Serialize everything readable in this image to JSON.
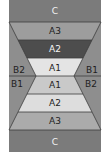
{
  "diagram": {
    "top": {
      "band_c": {
        "label": "C",
        "color": "#7b7b7b",
        "text_color": "#f2f2f2"
      },
      "a3": {
        "label": "A3",
        "color": "#9d9d9d",
        "text_color": "#1e1e1e"
      },
      "a2": {
        "label": "A2",
        "color": "#4d4d4d",
        "text_color": "#f5f5f5"
      },
      "a1": {
        "label": "A1",
        "color": "#e4e4e4",
        "text_color": "#1e1e1e"
      },
      "left_side": {
        "label": "B2"
      },
      "right_side": {
        "label": "B1"
      }
    },
    "bottom": {
      "a1": {
        "label": "A1",
        "color": "#c9c9c9",
        "text_color": "#1e1e1e"
      },
      "a2": {
        "label": "A2",
        "color": "#dddddd",
        "text_color": "#1e1e1e"
      },
      "a3": {
        "label": "A3",
        "color": "#ababab",
        "text_color": "#1e1e1e"
      },
      "band_c": {
        "label": "C",
        "color": "#7b7b7b",
        "text_color": "#f2f2f2"
      },
      "left_side": {
        "label": "B1"
      },
      "right_side": {
        "label": "B2"
      }
    },
    "side_color": "#8e8e8e",
    "side_text_color": "#1e1e1e",
    "line_color": "#3c3c3c"
  }
}
